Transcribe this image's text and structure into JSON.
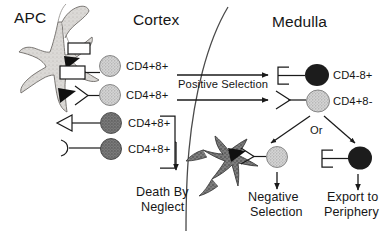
{
  "diagram": {
    "regions": [
      {
        "name": "cortex",
        "label": "Cortex"
      },
      {
        "name": "medulla",
        "label": "Medulla"
      }
    ],
    "cells": {
      "apc_cortex_label": "APC",
      "cortex_thymocytes": [
        {
          "label": "CD4+8+",
          "shade": "light"
        },
        {
          "label": "CD4+8+",
          "shade": "light"
        },
        {
          "label": "CD4+8+",
          "shade": "dark"
        },
        {
          "label": "CD4+8+",
          "shade": "dark"
        }
      ],
      "medulla_thymocytes": [
        {
          "label": "CD4-8+",
          "shade": "black"
        },
        {
          "label": "CD4+8-",
          "shade": "light"
        }
      ],
      "negative_selection_cell": {
        "label": "",
        "shade": "light"
      },
      "export_cell": {
        "label": "",
        "shade": "black"
      }
    },
    "flow": {
      "positive_selection": "Positive Selection",
      "death_by_neglect_line1": "Death By",
      "death_by_neglect_line2": "Neglect",
      "or": "Or",
      "negative_selection_line1": "Negative",
      "negative_selection_line2": "Selection",
      "export_line1": "Export to",
      "export_line2": "Periphery"
    },
    "colors": {
      "stroke": "#1a1a1a",
      "cell_light": "#c9c9c9",
      "cell_dark": "#6e6e6e",
      "cell_black": "#1c1c1c",
      "apc_light": "#d2d0cd",
      "apc_dark": "#6b6b6b",
      "text": "#161616",
      "background": "#ffffff"
    }
  }
}
